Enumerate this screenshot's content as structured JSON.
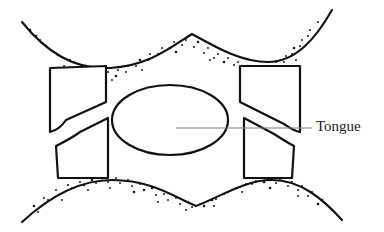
{
  "figure": {
    "background_color": "#ffffff",
    "ink_color": "#111111",
    "leader_color": "#808080",
    "label_color": "#1a1a1a",
    "labels": [
      {
        "id": "tongue",
        "text": "Tongue",
        "x": 316,
        "y": 128,
        "leader": {
          "x1": 176,
          "y1": 128,
          "x2": 312,
          "y2": 128
        }
      }
    ],
    "tongue_oval": {
      "name": "tongue",
      "cx": 170,
      "cy": 120,
      "rx": 58,
      "ry": 35
    },
    "tissue_curves": [
      {
        "name": "upper-tissue-curve",
        "path": "M 22 22 C 46 52 76 70 110 68 C 150 66 172 46 192 34 C 214 46 240 62 268 62 C 296 62 316 38 332 10",
        "stipple_side": "below"
      },
      {
        "name": "lower-tissue-curve",
        "path": "M 22 222 C 48 198 78 180 112 180 C 152 180 176 198 196 206 C 218 198 244 180 272 180 C 300 180 322 198 342 220",
        "stipple_side": "above"
      }
    ],
    "teeth": [
      {
        "name": "upper-left-tooth",
        "path": "M 50 68 L 50 132 C 58 130 62 126 66 120 L 106 102 L 106 66 Z"
      },
      {
        "name": "upper-right-tooth",
        "path": "M 240 66 L 240 102 L 284 124 C 290 128 294 131 300 132 L 300 66 Z"
      },
      {
        "name": "lower-left-tooth",
        "path": "M 56 146 C 64 142 72 138 80 132 L 108 118 L 108 178 L 58 178 Z"
      },
      {
        "name": "lower-right-tooth",
        "path": "M 244 118 L 274 134 C 282 139 288 143 294 146 L 292 178 L 244 178 Z"
      }
    ],
    "stipple": {
      "upper_dots": [
        [
          30,
          30
        ],
        [
          40,
          40
        ],
        [
          52,
          51
        ],
        [
          62,
          57
        ],
        [
          74,
          62
        ],
        [
          86,
          66
        ],
        [
          96,
          68
        ],
        [
          108,
          72
        ],
        [
          118,
          70
        ],
        [
          128,
          66
        ],
        [
          140,
          60
        ],
        [
          150,
          54
        ],
        [
          162,
          48
        ],
        [
          174,
          42
        ],
        [
          186,
          40
        ],
        [
          198,
          42
        ],
        [
          208,
          48
        ],
        [
          218,
          54
        ],
        [
          228,
          58
        ],
        [
          238,
          62
        ],
        [
          248,
          66
        ],
        [
          258,
          68
        ],
        [
          266,
          66
        ],
        [
          276,
          62
        ],
        [
          286,
          56
        ],
        [
          294,
          48
        ],
        [
          302,
          40
        ],
        [
          310,
          30
        ],
        [
          318,
          22
        ],
        [
          46,
          46
        ],
        [
          58,
          55
        ],
        [
          70,
          60
        ],
        [
          82,
          65
        ],
        [
          94,
          70
        ],
        [
          106,
          76
        ],
        [
          116,
          76
        ],
        [
          126,
          72
        ],
        [
          136,
          66
        ],
        [
          148,
          60
        ],
        [
          158,
          54
        ],
        [
          170,
          48
        ],
        [
          182,
          45
        ],
        [
          194,
          47
        ],
        [
          204,
          53
        ],
        [
          214,
          58
        ],
        [
          224,
          62
        ],
        [
          234,
          65
        ],
        [
          244,
          70
        ],
        [
          254,
          72
        ],
        [
          264,
          72
        ],
        [
          274,
          68
        ],
        [
          284,
          62
        ],
        [
          292,
          54
        ],
        [
          300,
          46
        ],
        [
          308,
          36
        ],
        [
          36,
          36
        ],
        [
          64,
          66
        ],
        [
          90,
          74
        ],
        [
          112,
          80
        ],
        [
          142,
          70
        ],
        [
          176,
          52
        ],
        [
          210,
          60
        ],
        [
          240,
          74
        ],
        [
          270,
          74
        ],
        [
          296,
          60
        ]
      ],
      "lower_dots": [
        [
          34,
          206
        ],
        [
          44,
          198
        ],
        [
          56,
          190
        ],
        [
          68,
          185
        ],
        [
          80,
          182
        ],
        [
          92,
          180
        ],
        [
          104,
          178
        ],
        [
          116,
          178
        ],
        [
          128,
          180
        ],
        [
          140,
          184
        ],
        [
          152,
          188
        ],
        [
          164,
          194
        ],
        [
          176,
          198
        ],
        [
          188,
          202
        ],
        [
          200,
          204
        ],
        [
          212,
          200
        ],
        [
          224,
          194
        ],
        [
          236,
          188
        ],
        [
          246,
          184
        ],
        [
          256,
          181
        ],
        [
          268,
          179
        ],
        [
          280,
          179
        ],
        [
          292,
          182
        ],
        [
          302,
          186
        ],
        [
          312,
          192
        ],
        [
          322,
          200
        ],
        [
          332,
          210
        ],
        [
          48,
          200
        ],
        [
          60,
          194
        ],
        [
          72,
          188
        ],
        [
          84,
          185
        ],
        [
          96,
          183
        ],
        [
          108,
          182
        ],
        [
          120,
          183
        ],
        [
          132,
          186
        ],
        [
          144,
          190
        ],
        [
          156,
          195
        ],
        [
          168,
          200
        ],
        [
          180,
          204
        ],
        [
          192,
          207
        ],
        [
          204,
          206
        ],
        [
          216,
          199
        ],
        [
          228,
          192
        ],
        [
          240,
          187
        ],
        [
          252,
          184
        ],
        [
          264,
          182
        ],
        [
          276,
          183
        ],
        [
          288,
          186
        ],
        [
          298,
          190
        ],
        [
          308,
          196
        ],
        [
          318,
          204
        ],
        [
          38,
          212
        ],
        [
          62,
          200
        ],
        [
          88,
          190
        ],
        [
          110,
          188
        ],
        [
          134,
          192
        ],
        [
          158,
          202
        ],
        [
          186,
          210
        ],
        [
          214,
          206
        ],
        [
          242,
          192
        ],
        [
          270,
          188
        ],
        [
          298,
          196
        ]
      ]
    }
  }
}
